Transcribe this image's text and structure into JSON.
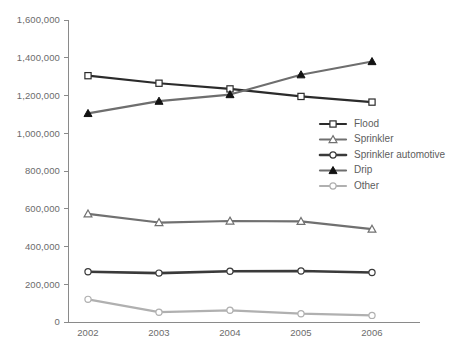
{
  "chart_data": {
    "type": "line",
    "title": "",
    "subtitle": "",
    "xlabel": "",
    "ylabel": "",
    "categories": [
      "2002",
      "2003",
      "2004",
      "2005",
      "2006"
    ],
    "x_tick_labels": [
      "2002",
      "2003",
      "2004",
      "2005",
      "2006"
    ],
    "y_tick_labels": [
      "0",
      "200,000",
      "400,000",
      "600,000",
      "800,000",
      "1,000,000",
      "1,200,000",
      "1,400,000",
      "1,600,000"
    ],
    "y_tick_values": [
      0,
      200000,
      400000,
      600000,
      800000,
      1000000,
      1200000,
      1400000,
      1600000
    ],
    "ylim": [
      0,
      1600000
    ],
    "grid": false,
    "legend_position": "center-right",
    "series": [
      {
        "name": "Flood",
        "values": [
          1305000,
          1265000,
          1235000,
          1195000,
          1165000
        ],
        "color": "#2b2b2b",
        "line_width": 2.2,
        "marker": "square-open"
      },
      {
        "name": "Sprinkler",
        "values": [
          573000,
          527000,
          535000,
          533000,
          492000
        ],
        "color": "#707070",
        "line_width": 2.2,
        "marker": "triangle-open"
      },
      {
        "name": "Sprinkler automotive",
        "values": [
          266000,
          259000,
          269000,
          270000,
          262000
        ],
        "color": "#3a3a3a",
        "line_width": 2.6,
        "marker": "circle-open"
      },
      {
        "name": "Drip",
        "values": [
          1105000,
          1170000,
          1205000,
          1310000,
          1380000
        ],
        "color": "#6e6e6e",
        "line_width": 2.2,
        "marker": "triangle-filled"
      },
      {
        "name": "Other",
        "values": [
          120000,
          52000,
          62000,
          44000,
          35000
        ],
        "color": "#b0b0b0",
        "line_width": 2.2,
        "marker": "circle-open"
      }
    ]
  },
  "legend": {
    "items": [
      {
        "label": "Flood"
      },
      {
        "label": "Sprinkler"
      },
      {
        "label": "Sprinkler automotive"
      },
      {
        "label": "Drip"
      },
      {
        "label": "Other"
      }
    ]
  },
  "colors": {
    "axis": "#8a8a8a",
    "text": "#5d5d5d",
    "background": "#ffffff"
  }
}
